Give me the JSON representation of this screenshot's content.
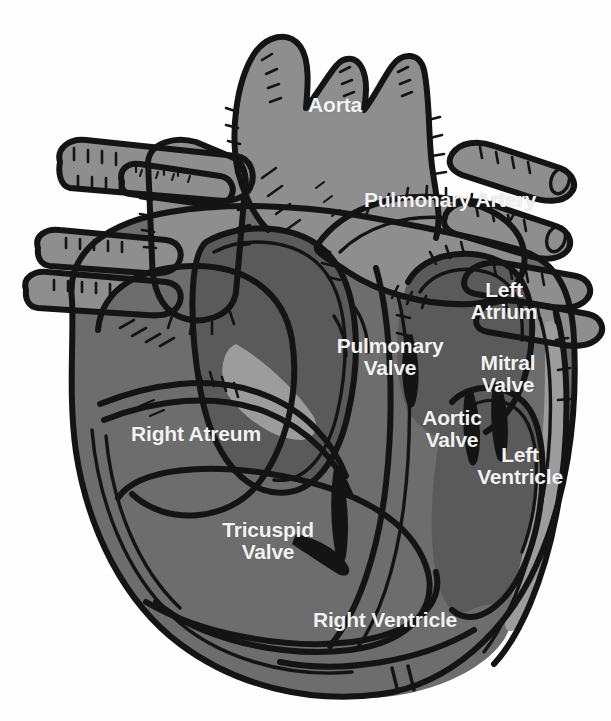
{
  "document": {
    "title": "Human Heart Cross-Section Anatomy Diagram",
    "type": "anatomical-illustration",
    "style": "hand-drawn ink line art, grayscale fill, white bold sans-serif labels",
    "background_color": "#ffffff",
    "label_color": "#f2f2f2",
    "outline_color": "#141414"
  },
  "palette": {
    "outline": "#141414",
    "vessel_light": "#8e8e8e",
    "muscle_mid": "#6d6d6d",
    "chamber_dark": "#5a5a5a",
    "chamber_darker": "#4f4f4f",
    "highlight_pale": "#9c9c9c",
    "background": "#ffffff",
    "label_text": "#f2f2f2"
  },
  "labels": [
    {
      "id": "aorta",
      "text": "Aorta",
      "lines": [
        "Aorta"
      ],
      "x": 335,
      "y": 105,
      "font_size": 21
    },
    {
      "id": "pulmonary-artery",
      "text": "Pulmonary Artery",
      "lines": [
        "Pulmonary Artery"
      ],
      "x": 450,
      "y": 200,
      "font_size": 21
    },
    {
      "id": "left-atrium",
      "text": "Left Atrium",
      "lines": [
        "Left",
        "Atrium"
      ],
      "x": 504,
      "y": 301,
      "font_size": 21
    },
    {
      "id": "pulmonary-valve",
      "text": "Pulmonary Valve",
      "lines": [
        "Pulmonary",
        "Valve"
      ],
      "x": 390,
      "y": 357,
      "font_size": 21
    },
    {
      "id": "mitral-valve",
      "text": "Mitral Valve",
      "lines": [
        "Mitral",
        "Valve"
      ],
      "x": 508,
      "y": 374,
      "font_size": 21
    },
    {
      "id": "aortic-valve",
      "text": "Aortic Valve",
      "lines": [
        "Aortic",
        "Valve"
      ],
      "x": 452,
      "y": 429,
      "font_size": 21
    },
    {
      "id": "left-ventricle",
      "text": "Left Ventricle",
      "lines": [
        "Left",
        "Ventricle"
      ],
      "x": 520,
      "y": 466,
      "font_size": 21
    },
    {
      "id": "right-atrium",
      "text": "Right Atreum",
      "lines": [
        "Right Atreum"
      ],
      "x": 196,
      "y": 434,
      "font_size": 21
    },
    {
      "id": "tricuspid-valve",
      "text": "Tricuspid Valve",
      "lines": [
        "Tricuspid",
        "Valve"
      ],
      "x": 268,
      "y": 541,
      "font_size": 21
    },
    {
      "id": "right-ventricle",
      "text": "Right Ventricle",
      "lines": [
        "Right Ventricle"
      ],
      "x": 385,
      "y": 620,
      "font_size": 21
    }
  ],
  "structures": [
    {
      "id": "aorta-trunk",
      "name": "Aorta",
      "fill": "#8e8e8e"
    },
    {
      "id": "brachiocephalic-branch",
      "name": "Brachiocephalic trunk",
      "fill": "#8e8e8e"
    },
    {
      "id": "carotid-branch",
      "name": "Left common carotid artery",
      "fill": "#8e8e8e"
    },
    {
      "id": "subclavian-branch",
      "name": "Left subclavian artery",
      "fill": "#8e8e8e"
    },
    {
      "id": "superior-vena-cava",
      "name": "Superior vena cava",
      "fill": "#8e8e8e"
    },
    {
      "id": "pulmonary-artery-trunk",
      "name": "Pulmonary artery",
      "fill": "#8e8e8e"
    },
    {
      "id": "right-pulmonary-veins",
      "name": "Right pulmonary vein stumps",
      "fill": "#8e8e8e"
    },
    {
      "id": "left-pulmonary-veins",
      "name": "Left pulmonary vein stumps",
      "fill": "#8e8e8e"
    },
    {
      "id": "right-atrium-chamber",
      "name": "Right atrium",
      "fill": "#6d6d6d"
    },
    {
      "id": "right-ventricle-chamber",
      "name": "Right ventricle",
      "fill": "#6d6d6d"
    },
    {
      "id": "left-atrium-chamber",
      "name": "Left atrium",
      "fill": "#5a5a5a"
    },
    {
      "id": "left-ventricle-chamber",
      "name": "Left ventricle",
      "fill": "#5a5a5a"
    },
    {
      "id": "septum",
      "name": "Interventricular septum",
      "fill": "#6d6d6d"
    },
    {
      "id": "tricuspid-leaflets",
      "name": "Tricuspid valve leaflets",
      "fill": "#141414"
    },
    {
      "id": "mitral-leaflets",
      "name": "Mitral valve leaflets",
      "fill": "#141414"
    },
    {
      "id": "aortic-cusps",
      "name": "Aortic valve cusps",
      "fill": "#141414"
    },
    {
      "id": "pulmonary-cusps",
      "name": "Pulmonary valve cusps",
      "fill": "#141414"
    },
    {
      "id": "apex",
      "name": "Cardiac apex",
      "fill": "#6d6d6d"
    }
  ]
}
